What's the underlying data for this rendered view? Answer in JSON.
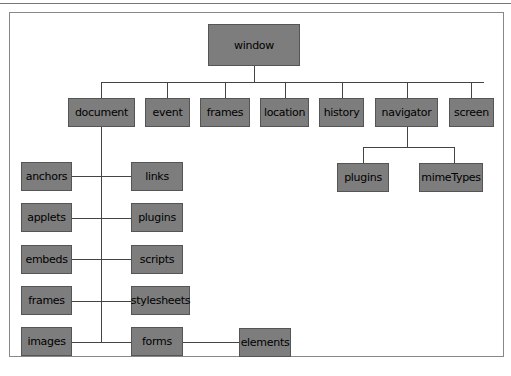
{
  "diagram": {
    "colors": {
      "box_fill": "#7d7d7d",
      "box_border": "#555555",
      "line": "#444444",
      "frame": "#888888"
    },
    "nodes": {
      "window": "window",
      "document": "document",
      "event": "event",
      "frames": "frames",
      "location": "location",
      "history": "history",
      "navigator": "navigator",
      "screen": "screen",
      "nav_plugins": "plugins",
      "mimeTypes": "mimeTypes",
      "anchors": "anchors",
      "links": "links",
      "applets": "applets",
      "plugins": "plugins",
      "embeds": "embeds",
      "scripts": "scripts",
      "doc_frames": "frames",
      "stylesheets": "stylesheets",
      "images": "images",
      "forms": "forms",
      "elements": "elements"
    }
  }
}
